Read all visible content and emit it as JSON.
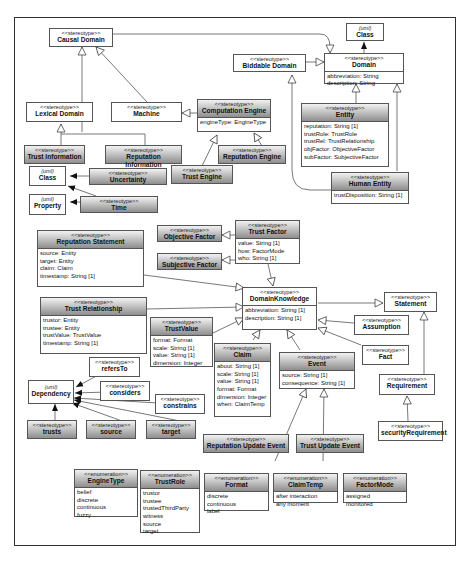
{
  "diagram": {
    "type": "UML class diagram (profile of stereotypes)",
    "boxes": {
      "causal_domain": {
        "stereotype": "<<stereotype>>",
        "name": "Causal Domain"
      },
      "uml_class_top": {
        "stereotype": "(uml)",
        "name": "Class"
      },
      "biddable_domain": {
        "stereotype": "<<stereotype>>",
        "name": "Biddable Domain"
      },
      "domain": {
        "stereotype": "<<stereotype>>",
        "name": "Domain",
        "attributes": [
          "abbreviation: String",
          "description: String"
        ]
      },
      "lexical_domain": {
        "stereotype": "<<stereotype>>",
        "name": "Lexical Domain"
      },
      "machine": {
        "stereotype": "<<stereotype>>",
        "name": "Machine"
      },
      "computation_engine": {
        "stereotype": "<<stereotype>>",
        "name": "Computation Engine",
        "attributes": [
          "engineType: EngineType"
        ]
      },
      "entity": {
        "stereotype": "<<stereotype>>",
        "name": "Entity",
        "attributes": [
          "reputation: String [1]",
          "trustRole: TrustRole",
          "trustRel: TrustRelationship",
          "objFactor: ObjectiveFactor",
          "subFactor: SubjectiveFactor"
        ]
      },
      "trust_information": {
        "stereotype": "<<stereotype>>",
        "name": "Trust Information"
      },
      "reputation_information": {
        "stereotype": "<<stereotype>>",
        "name": "Reputation Information"
      },
      "reputation_engine": {
        "stereotype": "<<stereotype>>",
        "name": "Reputation Engine"
      },
      "uncertainty": {
        "stereotype": "<<stereotype>>",
        "name": "Uncertainty"
      },
      "trust_engine": {
        "stereotype": "<<stereotype>>",
        "name": "Trust  Engine"
      },
      "uml_class_left": {
        "stereotype": "(uml)",
        "name": "Class"
      },
      "human_entity": {
        "stereotype": "<<stereotype>>",
        "name": "Human Entity",
        "attributes": [
          "trustDisposition: String [1]"
        ]
      },
      "uml_property": {
        "stereotype": "(uml)",
        "name": "Property"
      },
      "time": {
        "stereotype": "<<stereotype>>",
        "name": "Time"
      },
      "objective_factor": {
        "stereotype": "<<stereotype>>",
        "name": "Objective Factor"
      },
      "trust_factor": {
        "stereotype": "<<stereotype>>",
        "name": "Trust  Factor",
        "attributes": [
          "value: String [1]",
          "how: FactorMode",
          "who: String [1]"
        ]
      },
      "reputation_statement": {
        "stereotype": "<<stereotype>>",
        "name": "Reputation Statement",
        "attributes": [
          "source: Entity",
          "target: Entity",
          "claim: Claim",
          "timestamp: String [1]"
        ]
      },
      "subjective_factor": {
        "stereotype": "<<stereotype>>",
        "name": "Subjective Factor"
      },
      "domain_knowledge": {
        "stereotype": "<<stereotype>>",
        "name": "DomainKnowledge",
        "attributes": [
          "abbreviation: String [1]",
          "description: String [1]"
        ]
      },
      "statement": {
        "stereotype": "<<stereotype>>",
        "name": "Statement"
      },
      "trust_relationship": {
        "stereotype": "<<stereotype>>",
        "name": "Trust Relationship",
        "attributes": [
          "trustor: Entity",
          "trustee: Entity",
          "trustValue: TrustValue",
          "timestamp: String [1]"
        ]
      },
      "assumption": {
        "stereotype": "<<stereotype>>",
        "name": "Assumption"
      },
      "trust_value": {
        "stereotype": "<<stereotype>>",
        "name": "TrustValue",
        "attributes": [
          "format: Format",
          "scale: String [1]",
          "value: String [1]",
          "dimension: Integer"
        ]
      },
      "fact": {
        "stereotype": "<<stereotype>>",
        "name": "Fact"
      },
      "refers_to": {
        "stereotype": "<<stereotype>>",
        "name": "refersTo"
      },
      "claim": {
        "stereotype": "<<stereotype>>",
        "name": "Claim",
        "attributes": [
          "about: String [1]",
          "scale: String [1]",
          "value: String [1]",
          "format: Format",
          "dimension: Integer",
          "when: ClaimTemp"
        ]
      },
      "event": {
        "stereotype": "<<stereotype>>",
        "name": "Event",
        "attributes": [
          "source: String [1]",
          "consequence: String [1]"
        ]
      },
      "uml_dependency": {
        "stereotype": "(uml)",
        "name": "Dependency"
      },
      "considers": {
        "stereotype": "<<stereotype>>",
        "name": "considers"
      },
      "requirement": {
        "stereotype": "<<stereotype>>",
        "name": "Requirement"
      },
      "constrains": {
        "stereotype": "<<stereotype>>",
        "name": "constrains"
      },
      "trusts": {
        "stereotype": "<<stereotype>>",
        "name": "trusts"
      },
      "source": {
        "stereotype": "<<stereotype>>",
        "name": "source"
      },
      "target": {
        "stereotype": "<<stereotype>>",
        "name": "target"
      },
      "security_requirement": {
        "stereotype": "<<stereotype>>",
        "name": "securityRequirement"
      },
      "reputation_update_event": {
        "stereotype": "<<stereotype>>",
        "name": "Reputation Update Event"
      },
      "trust_update_event": {
        "stereotype": "<<stereotype>>",
        "name": "Trust Update Event"
      }
    },
    "enumerations": {
      "engine_type": {
        "stereotype": "<<enumeration>>",
        "name": "EngineType",
        "literals": [
          "belief",
          "discrete",
          "continuous",
          "fuzzy"
        ]
      },
      "trust_role": {
        "stereotype": "<<enumeration>>",
        "name": "TrustRole",
        "literals": [
          "trustor",
          "trustee",
          "trustedThirdParty",
          "witness",
          "source",
          "target"
        ]
      },
      "format": {
        "stereotype": "<<enumeration>>",
        "name": "Format",
        "literals": [
          "discrete",
          "continuous",
          "label"
        ]
      },
      "claim_temp": {
        "stereotype": "<<enumeration>>",
        "name": "ClaimTemp",
        "literals": [
          "after interaction",
          "any moment"
        ]
      },
      "factor_mode": {
        "stereotype": "<<enumeration>>",
        "name": "FactorMode",
        "literals": [
          "assigned",
          "monitored"
        ]
      }
    },
    "relationships": [
      {
        "from": "Lexical Domain",
        "to": "Causal Domain",
        "kind": "generalization"
      },
      {
        "from": "Machine",
        "to": "Causal Domain",
        "kind": "generalization"
      },
      {
        "from": "Causal Domain",
        "to": "Domain",
        "kind": "generalization"
      },
      {
        "from": "Biddable Domain",
        "to": "Domain",
        "kind": "generalization"
      },
      {
        "from": "Domain",
        "to": "Class",
        "kind": "extension"
      },
      {
        "from": "Computation Engine",
        "to": "Machine",
        "kind": "generalization"
      },
      {
        "from": "Entity",
        "to": "Domain",
        "kind": "generalization"
      },
      {
        "from": "Human Entity",
        "to": "Domain",
        "kind": "generalization"
      },
      {
        "from": "Human Entity",
        "to": "Biddable Domain",
        "kind": "generalization"
      },
      {
        "from": "Trust Information",
        "to": "Lexical Domain",
        "kind": "generalization"
      },
      {
        "from": "Reputation Information",
        "to": "Lexical Domain",
        "kind": "generalization"
      },
      {
        "from": "Trust  Engine",
        "to": "Computation Engine",
        "kind": "generalization"
      },
      {
        "from": "Reputation Engine",
        "to": "Computation Engine",
        "kind": "generalization"
      },
      {
        "from": "Uncertainty",
        "to": "Class",
        "kind": "extension"
      },
      {
        "from": "Time",
        "to": "Class",
        "kind": "extension"
      },
      {
        "from": "Time",
        "to": "Property",
        "kind": "extension"
      },
      {
        "from": "Objective Factor",
        "to": "Trust  Factor",
        "kind": "generalization"
      },
      {
        "from": "Subjective Factor",
        "to": "Trust  Factor",
        "kind": "generalization"
      },
      {
        "from": "Trust  Factor",
        "to": "DomainKnowledge",
        "kind": "generalization"
      },
      {
        "from": "Reputation Statement",
        "to": "DomainKnowledge",
        "kind": "generalization"
      },
      {
        "from": "Trust Relationship",
        "to": "DomainKnowledge",
        "kind": "generalization"
      },
      {
        "from": "TrustValue",
        "to": "DomainKnowledge",
        "kind": "generalization"
      },
      {
        "from": "Claim",
        "to": "DomainKnowledge",
        "kind": "generalization"
      },
      {
        "from": "Event",
        "to": "DomainKnowledge",
        "kind": "generalization"
      },
      {
        "from": "Assumption",
        "to": "DomainKnowledge",
        "kind": "generalization"
      },
      {
        "from": "Fact",
        "to": "DomainKnowledge",
        "kind": "generalization"
      },
      {
        "from": "DomainKnowledge",
        "to": "Statement",
        "kind": "generalization"
      },
      {
        "from": "Requirement",
        "to": "Statement",
        "kind": "generalization"
      },
      {
        "from": "securityRequirement",
        "to": "Requirement",
        "kind": "generalization"
      },
      {
        "from": "Reputation Update Event",
        "to": "Event",
        "kind": "generalization"
      },
      {
        "from": "Trust Update Event",
        "to": "Event",
        "kind": "generalization"
      },
      {
        "from": "refersTo",
        "to": "Dependency",
        "kind": "extension"
      },
      {
        "from": "considers",
        "to": "Dependency",
        "kind": "extension"
      },
      {
        "from": "constrains",
        "to": "Dependency",
        "kind": "extension"
      },
      {
        "from": "trusts",
        "to": "Dependency",
        "kind": "extension"
      },
      {
        "from": "source",
        "to": "Dependency",
        "kind": "extension"
      },
      {
        "from": "target",
        "to": "Dependency",
        "kind": "extension"
      }
    ]
  }
}
